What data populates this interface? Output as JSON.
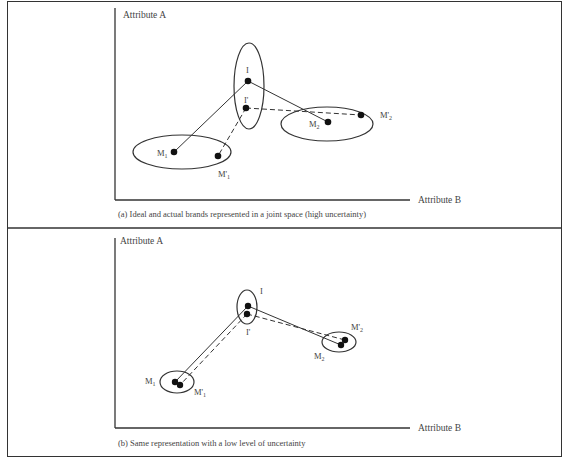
{
  "panels": [
    {
      "id": "a",
      "y_axis_label": "Attribute A",
      "x_axis_label": "Attribute B",
      "caption_prefix": "(a)",
      "caption": "Ideal and actual brands represented in a joint space (high uncertainty)",
      "points": {
        "I": {
          "label": "I"
        },
        "I_prime": {
          "label": "I'"
        },
        "M1": {
          "label": "M",
          "sub": "1"
        },
        "M1_prime": {
          "label": "M'",
          "sub": "1"
        },
        "M2": {
          "label": "M",
          "sub": "2"
        },
        "M2_prime": {
          "label": "M'",
          "sub": "2"
        }
      },
      "uncertainty": "high"
    },
    {
      "id": "b",
      "y_axis_label": "Attribute A",
      "x_axis_label": "Attribute B",
      "caption_prefix": "(b)",
      "caption": "Same representation with a low level of uncertainty",
      "points": {
        "I": {
          "label": "I"
        },
        "I_prime": {
          "label": "I'"
        },
        "M1": {
          "label": "M",
          "sub": "1"
        },
        "M1_prime": {
          "label": "M'",
          "sub": "1"
        },
        "M2": {
          "label": "M",
          "sub": "2"
        },
        "M2_prime": {
          "label": "M'",
          "sub": "2"
        }
      },
      "uncertainty": "low"
    }
  ],
  "legend": {
    "solid_line": "ideal point I to actual brands",
    "dashed_line": "perceived ideal I' to perceived brands"
  }
}
